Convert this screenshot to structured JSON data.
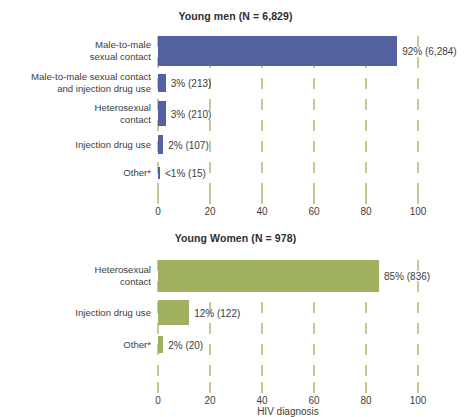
{
  "chart_data": [
    {
      "type": "bar",
      "orientation": "horizontal",
      "title": "Young men (N = 6,829)",
      "categories": [
        "Male-to-male\nsexual contact",
        "Male-to-male sexual contact\nand injection drug use",
        "Heterosexual\ncontact",
        "Injection drug use",
        "Other*"
      ],
      "values": [
        92,
        3,
        3,
        2,
        0.4
      ],
      "data_labels": [
        "92% (6,284)",
        "3% (213)",
        "3% (210)",
        "2% (107)",
        "<1% (15)"
      ],
      "counts": [
        6284,
        213,
        210,
        107,
        15
      ],
      "xlabel": "",
      "ylabel": "",
      "xlim": [
        0,
        100
      ],
      "xticks": [
        0,
        20,
        40,
        60,
        80,
        100
      ],
      "grid": true,
      "legend": "none",
      "color": "#5361a1"
    },
    {
      "type": "bar",
      "orientation": "horizontal",
      "title": "Young Women (N = 978)",
      "categories": [
        "Heterosexual\ncontact",
        "Injection drug use",
        "Other*"
      ],
      "values": [
        85,
        12,
        2
      ],
      "data_labels": [
        "85% (836)",
        "12% (122)",
        "2% (20)"
      ],
      "counts": [
        836,
        122,
        20
      ],
      "xlabel": "HIV diagnosis",
      "ylabel": "",
      "xlim": [
        0,
        100
      ],
      "xticks": [
        0,
        20,
        40,
        60,
        80,
        100
      ],
      "grid": true,
      "legend": "none",
      "color": "#9fb061"
    }
  ],
  "men": {
    "title": "Young men (N = 6,829)",
    "rows": [
      {
        "label_line1": "Male-to-male",
        "label_line2": "sexual contact",
        "value": 92,
        "data_label": "92% (6,284)"
      },
      {
        "label_line1": "Male-to-male sexual contact",
        "label_line2": "and injection drug use",
        "value": 3,
        "data_label": "3% (213)"
      },
      {
        "label_line1": "Heterosexual",
        "label_line2": "contact",
        "value": 3,
        "data_label": "3% (210)"
      },
      {
        "label_line1": "Injection drug use",
        "label_line2": "",
        "value": 2,
        "data_label": "2% (107)"
      },
      {
        "label_line1": "Other*",
        "label_line2": "",
        "value": 0.4,
        "data_label": "<1% (15)"
      }
    ],
    "ticks": [
      "0",
      "20",
      "40",
      "60",
      "80",
      "100"
    ]
  },
  "women": {
    "title": "Young Women (N = 978)",
    "rows": [
      {
        "label_line1": "Heterosexual",
        "label_line2": "contact",
        "value": 85,
        "data_label": "85% (836)"
      },
      {
        "label_line1": "Injection drug use",
        "label_line2": "",
        "value": 12,
        "data_label": "12% (122)"
      },
      {
        "label_line1": "Other*",
        "label_line2": "",
        "value": 2,
        "data_label": "2% (20)"
      }
    ],
    "ticks": [
      "0",
      "20",
      "40",
      "60",
      "80",
      "100"
    ],
    "axis_title": "HIV diagnosis"
  },
  "colors": {
    "men_bar": "#5361a1",
    "women_bar": "#9fb061",
    "grid": "#c9c88f",
    "text": "#3d3d3d",
    "background": "#ffffff"
  }
}
